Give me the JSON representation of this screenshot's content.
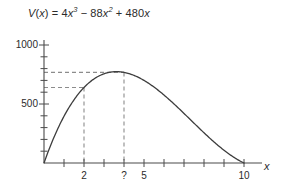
{
  "chart_data": {
    "type": "line",
    "title_parts": {
      "v": "V",
      "open": "(",
      "var": "x",
      "close": ")",
      "eq": " = 4",
      "x1": "x",
      "sup1": "3",
      "minus": " − 88",
      "x2": "x",
      "sup2": "2",
      "plus": " + 480",
      "x3": "x"
    },
    "xlabel": "x",
    "ylabel": "",
    "xlim": [
      0,
      11.4
    ],
    "ylim": [
      0,
      1100
    ],
    "grid": false,
    "legend": null,
    "x_tick_labels": [
      {
        "value": 2,
        "label": "2"
      },
      {
        "value": 4,
        "label": "?"
      },
      {
        "value": 5,
        "label": "5"
      },
      {
        "value": 10,
        "label": "10"
      }
    ],
    "x_ticks_all": [
      1,
      2,
      3,
      4,
      5,
      6,
      7,
      8,
      9,
      10
    ],
    "y_tick_labels": [
      {
        "value": 1000,
        "label": "1000"
      },
      {
        "value": 500,
        "label": "500"
      }
    ],
    "y_ticks_all": [
      100,
      200,
      300,
      400,
      500,
      600,
      700,
      800,
      900,
      1000
    ],
    "series": [
      {
        "name": "V(x)",
        "color": "#3d3d3d",
        "x": [
          0,
          0.25,
          0.5,
          0.75,
          1,
          1.25,
          1.5,
          1.75,
          2,
          2.25,
          2.5,
          2.75,
          3,
          3.25,
          3.5,
          3.75,
          4,
          4.25,
          4.5,
          4.75,
          5,
          5.5,
          6,
          6.5,
          7,
          7.5,
          8,
          8.5,
          9,
          9.5,
          10,
          10.5,
          11
        ],
        "y": [
          0,
          114.56,
          221.5,
          321.19,
          396,
          480.06,
          549,
          605.19,
          640,
          676.69,
          705,
          725.81,
          732,
          741.81,
          735,
          723.19,
          704,
          686.31,
          661.5,
          631.44,
          600,
          528.5,
          456,
          377.0,
          308,
          232.5,
          160,
          97.75,
          36,
          0.5,
          0,
          35.0,
          156
        ]
      }
    ],
    "annotations": [
      {
        "name": "maximum-guide",
        "x": 4,
        "y": 768,
        "style": "dashed",
        "color": "#8c8c8c",
        "label": "?"
      },
      {
        "name": "x2-guide",
        "x": 2,
        "y": 640,
        "style": "dashed",
        "color": "#8c8c8c",
        "label": "2"
      }
    ],
    "colors": {
      "curve": "#3d3d3d",
      "axis": "#4a4a4a",
      "dashed_guide": "#8c8c8c",
      "text": "#2b2b2b",
      "background": "#ffffff"
    }
  },
  "figure": {
    "x_axis_name": "x"
  }
}
